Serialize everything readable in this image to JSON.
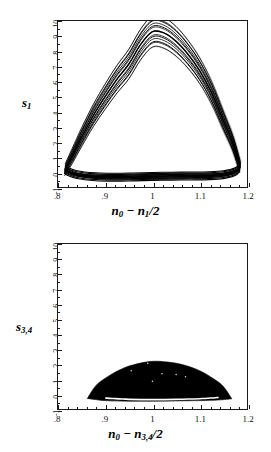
{
  "figure": {
    "kind": "two stacked phase-space attractor plots"
  },
  "chart_data": [
    {
      "type": "line",
      "panel": "top",
      "title": "",
      "xlabel": "n_0 - n_1/2",
      "ylabel": "s_1",
      "xlabel_parts": {
        "lead": "n",
        "lead_sub": "0",
        "op": " − ",
        "second": "n",
        "second_sub": "1",
        "tail": "/2"
      },
      "ylabel_parts": {
        "base": "s",
        "sub": "1"
      },
      "xlim": [
        0.8,
        1.2
      ],
      "ylim": [
        -1,
        10
      ],
      "xticks": [
        0.8,
        0.9,
        1.0,
        1.1,
        1.2
      ],
      "xticklabels": [
        ".8",
        ".9",
        "1",
        "1.1",
        "1.2"
      ],
      "yticks": [
        -1,
        0,
        1,
        2,
        3,
        4,
        5,
        6,
        7,
        8,
        9,
        10
      ],
      "yticklabels": [
        "-1",
        "0",
        "1",
        "2",
        "3",
        "4",
        "5",
        "6",
        "7",
        "8",
        "9",
        "10"
      ],
      "grid": false,
      "legend": null,
      "description": "Dense chaotic attractor: a broad arch of many overlapping trajectory strands rising from the lower-left, peaking near s_1 = 9.3 at n_0-n_1/2 = 1.0, and descending to the lower-right, closed by a thin horizontal band of strands near s_1 = 0.",
      "upper_branch_x": [
        0.815,
        0.83,
        0.85,
        0.875,
        0.9,
        0.925,
        0.95,
        0.975,
        1.0,
        1.025,
        1.05,
        1.075,
        1.1,
        1.125,
        1.15,
        1.17,
        1.185
      ],
      "upper_branch_y": [
        0.15,
        1.05,
        2.3,
        3.75,
        5.0,
        6.15,
        7.15,
        8.45,
        9.3,
        9.2,
        8.65,
        7.8,
        6.7,
        5.25,
        3.4,
        1.9,
        0.35
      ],
      "lower_branch_x": [
        0.815,
        0.84,
        0.88,
        0.92,
        0.96,
        1.0,
        1.04,
        1.08,
        1.12,
        1.15,
        1.175,
        1.185
      ],
      "lower_branch_y": [
        0.1,
        -0.18,
        -0.32,
        -0.35,
        -0.33,
        -0.3,
        -0.28,
        -0.27,
        -0.25,
        -0.18,
        0.02,
        0.3
      ],
      "peak": {
        "x": 1.0,
        "y": 9.3
      },
      "band_count": 7
    },
    {
      "type": "area",
      "panel": "bottom",
      "title": "",
      "xlabel": "n_0 - n_3,4/2",
      "ylabel": "s_3,4",
      "xlabel_parts": {
        "lead": "n",
        "lead_sub": "0",
        "op": " − ",
        "second": "n",
        "second_sub": "3,4",
        "tail": "/2"
      },
      "ylabel_parts": {
        "base": "s",
        "sub": "3,4"
      },
      "xlim": [
        0.8,
        1.2
      ],
      "ylim": [
        -1,
        10
      ],
      "xticks": [
        0.8,
        0.9,
        1.0,
        1.1,
        1.2
      ],
      "xticklabels": [
        ".8",
        ".9",
        "1",
        "1.1",
        "1.2"
      ],
      "yticks": [
        -1,
        0,
        1,
        2,
        3,
        4,
        5,
        6,
        7,
        8,
        9,
        10
      ],
      "yticklabels": [
        "-1",
        "0",
        "1",
        "2",
        "3",
        "4",
        "5",
        "6",
        "7",
        "8",
        "9",
        "10"
      ],
      "grid": false,
      "legend": null,
      "description": "Solid filled lens / crescent-shaped attractor occupying only the low-s region: spans n_0-n_3,4/2 from about 0.86 to 1.17, topping out near s_3,4 = 2.2 at x = 1.0, with a thin white sliver separating the dense body from the flat lower boundary near s_3,4 = -0.35.",
      "upper_envelope_x": [
        0.862,
        0.88,
        0.9,
        0.93,
        0.96,
        1.0,
        1.04,
        1.07,
        1.1,
        1.13,
        1.15,
        1.168
      ],
      "upper_envelope_y": [
        -0.3,
        0.55,
        1.05,
        1.6,
        1.95,
        2.18,
        2.1,
        1.9,
        1.55,
        1.0,
        0.5,
        -0.32
      ],
      "lower_envelope_x": [
        0.862,
        0.9,
        0.95,
        1.0,
        1.05,
        1.1,
        1.14,
        1.168
      ],
      "lower_envelope_y": [
        -0.3,
        -0.44,
        -0.48,
        -0.48,
        -0.46,
        -0.44,
        -0.4,
        -0.32
      ],
      "sliver_x": [
        0.9,
        0.95,
        1.0,
        1.05,
        1.1,
        1.14
      ],
      "sliver_y": [
        -0.22,
        -0.3,
        -0.32,
        -0.3,
        -0.26,
        -0.18
      ],
      "peak": {
        "x": 1.0,
        "y": 2.2
      }
    }
  ],
  "colors": {
    "ink": "#111111",
    "frame": "#1a1a1a",
    "background": "#ffffff"
  }
}
